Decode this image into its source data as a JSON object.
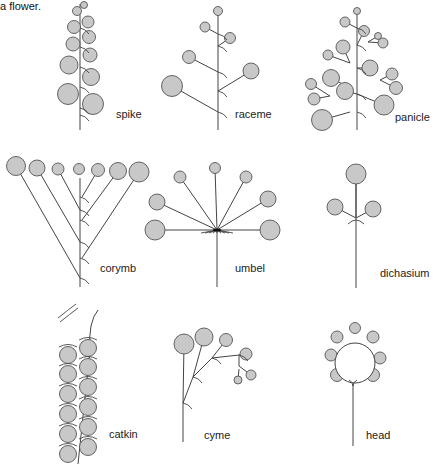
{
  "caption": "a flower.",
  "colors": {
    "flower_fill": "#c8c8c8",
    "flower_stroke": "#555555",
    "stem": "#444444",
    "background": "#ffffff"
  },
  "inflorescences": [
    {
      "id": "spike",
      "label": "spike",
      "label_pos": [
        116,
        118
      ],
      "stem": [
        [
          80,
          4
        ],
        [
          80,
          130
        ]
      ],
      "flowers": [
        [
          84,
          5,
          3.5
        ],
        [
          77,
          11,
          4.5
        ],
        [
          88,
          22,
          6
        ],
        [
          74,
          27,
          6.5
        ],
        [
          89,
          37,
          6.5
        ],
        [
          73,
          44,
          7
        ],
        [
          90,
          55,
          7
        ],
        [
          69,
          65,
          9
        ],
        [
          91,
          77,
          8.5
        ],
        [
          68,
          94,
          10.5
        ],
        [
          93,
          104,
          10.5
        ]
      ],
      "bracts": [
        [
          80,
          28
        ],
        [
          80,
          47
        ],
        [
          80,
          67
        ],
        [
          80,
          87
        ],
        [
          80,
          108
        ],
        [
          80,
          115
        ]
      ]
    },
    {
      "id": "raceme",
      "label": "raceme",
      "label_pos": [
        235,
        118
      ],
      "stem": [
        [
          218,
          8
        ],
        [
          218,
          130
        ]
      ],
      "flowers": [
        [
          218,
          11,
          4.5,
          218,
          11
        ],
        [
          205,
          27,
          5,
          218,
          34
        ],
        [
          230,
          38,
          5.5,
          218,
          46
        ],
        [
          189,
          57,
          6.5,
          218,
          72
        ],
        [
          251,
          71,
          8,
          218,
          91
        ],
        [
          172,
          86,
          10.5,
          218,
          112
        ]
      ],
      "bracts": [
        [
          218,
          34
        ],
        [
          218,
          46
        ],
        [
          218,
          72
        ],
        [
          218,
          91
        ],
        [
          218,
          112
        ]
      ]
    },
    {
      "id": "panicle",
      "label": "panicle",
      "label_pos": [
        395,
        121
      ],
      "stem": [
        [
          357,
          8
        ],
        [
          357,
          130
        ]
      ],
      "flowers": [
        [
          357,
          11,
          3.5,
          357,
          11
        ],
        [
          345,
          22,
          5,
          357,
          28
        ],
        [
          364,
          31,
          5.5,
          357,
          45
        ],
        [
          378,
          36,
          3.5,
          368,
          42
        ],
        [
          383,
          43,
          5,
          368,
          42
        ],
        [
          343,
          47,
          7,
          350,
          63
        ],
        [
          328,
          55,
          5,
          350,
          63
        ],
        [
          370,
          68,
          8,
          357,
          68
        ],
        [
          392,
          74,
          6,
          380,
          80
        ],
        [
          331,
          78,
          8.5,
          350,
          88
        ],
        [
          396,
          88,
          6.5,
          380,
          80
        ],
        [
          345,
          91,
          8.5,
          357,
          94
        ],
        [
          311,
          84,
          5.5,
          330,
          96
        ],
        [
          314,
          99,
          6,
          330,
          96
        ],
        [
          384,
          105,
          10,
          357,
          94
        ],
        [
          322,
          120,
          10.5,
          350,
          112
        ]
      ],
      "bracts": [
        [
          357,
          28
        ],
        [
          357,
          45
        ],
        [
          357,
          68
        ],
        [
          357,
          94
        ],
        [
          357,
          112
        ]
      ]
    },
    {
      "id": "corymb",
      "label": "corymb",
      "label_pos": [
        100,
        272
      ],
      "stem": [
        [
          80,
          178
        ],
        [
          80,
          287
        ]
      ],
      "flowers": [
        [
          16,
          166,
          9.5,
          80,
          278
        ],
        [
          37,
          168,
          8,
          80,
          242
        ],
        [
          58,
          169,
          6,
          80,
          210
        ],
        [
          79,
          169,
          5.5,
          80,
          169
        ],
        [
          98,
          170,
          6.5,
          82,
          197
        ],
        [
          118,
          171,
          8.5,
          82,
          220
        ],
        [
          139,
          172,
          10,
          82,
          258
        ]
      ],
      "bracts": [
        [
          80,
          197
        ],
        [
          80,
          210
        ],
        [
          80,
          220
        ],
        [
          80,
          242
        ],
        [
          80,
          258
        ],
        [
          80,
          278
        ]
      ]
    },
    {
      "id": "umbel",
      "label": "umbel",
      "label_pos": [
        235,
        272
      ],
      "stem": [
        [
          217,
          230
        ],
        [
          217,
          287
        ]
      ],
      "center": [
        217,
        230
      ],
      "flowers": [
        [
          215,
          168,
          5.5
        ],
        [
          180,
          177,
          6
        ],
        [
          246,
          177,
          6
        ],
        [
          157,
          202,
          8
        ],
        [
          268,
          199,
          8
        ],
        [
          155,
          230,
          10
        ],
        [
          270,
          230,
          10
        ]
      ]
    },
    {
      "id": "dichasium",
      "label": "dichasium",
      "label_pos": [
        380,
        277
      ],
      "stem": [
        [
          356,
          183
        ],
        [
          356,
          288
        ]
      ],
      "center": [
        356,
        218
      ],
      "flowers": [
        [
          356,
          174,
          10
        ],
        [
          335,
          207,
          8
        ],
        [
          373,
          209,
          8
        ]
      ]
    },
    {
      "id": "catkin",
      "label": "catkin",
      "label_pos": [
        109,
        438
      ],
      "stem": [
        [
          78,
          310
        ],
        [
          78,
          464
        ]
      ],
      "flowers": [
        [
          68,
          355,
          8.5
        ],
        [
          88,
          348,
          8.5
        ],
        [
          68,
          374,
          8.5
        ],
        [
          88,
          367,
          8.5
        ],
        [
          68,
          394,
          8.5
        ],
        [
          88,
          387,
          8.5
        ],
        [
          68,
          414,
          8.5
        ],
        [
          88,
          407,
          8.5
        ],
        [
          68,
          434,
          8.5
        ],
        [
          88,
          427,
          8.5
        ],
        [
          68,
          454,
          8.5
        ],
        [
          88,
          447,
          8.5
        ]
      ]
    },
    {
      "id": "cyme",
      "label": "cyme",
      "label_pos": [
        204,
        439
      ],
      "stem": [
        [
          183,
          442
        ],
        [
          183,
          403
        ]
      ],
      "flowers": [
        [
          184,
          344,
          10
        ],
        [
          204,
          337,
          9
        ],
        [
          226,
          340,
          6.5,
          193,
          377
        ],
        [
          246,
          354,
          6,
          212,
          358
        ],
        [
          251,
          375,
          5,
          239,
          366
        ],
        [
          238,
          380,
          4,
          239,
          369
        ]
      ]
    },
    {
      "id": "head",
      "label": "head",
      "label_pos": [
        366,
        439
      ],
      "stem": [
        [
          353,
          446
        ],
        [
          353,
          384
        ]
      ],
      "receptacle": [
        355,
        363,
        20
      ],
      "flowers": [
        [
          355,
          328,
          5.5
        ],
        [
          337,
          337,
          6
        ],
        [
          373,
          337,
          6
        ],
        [
          331,
          355,
          6
        ],
        [
          380,
          358,
          6
        ],
        [
          337,
          375,
          6.5
        ],
        [
          373,
          375,
          6.5
        ]
      ]
    }
  ]
}
